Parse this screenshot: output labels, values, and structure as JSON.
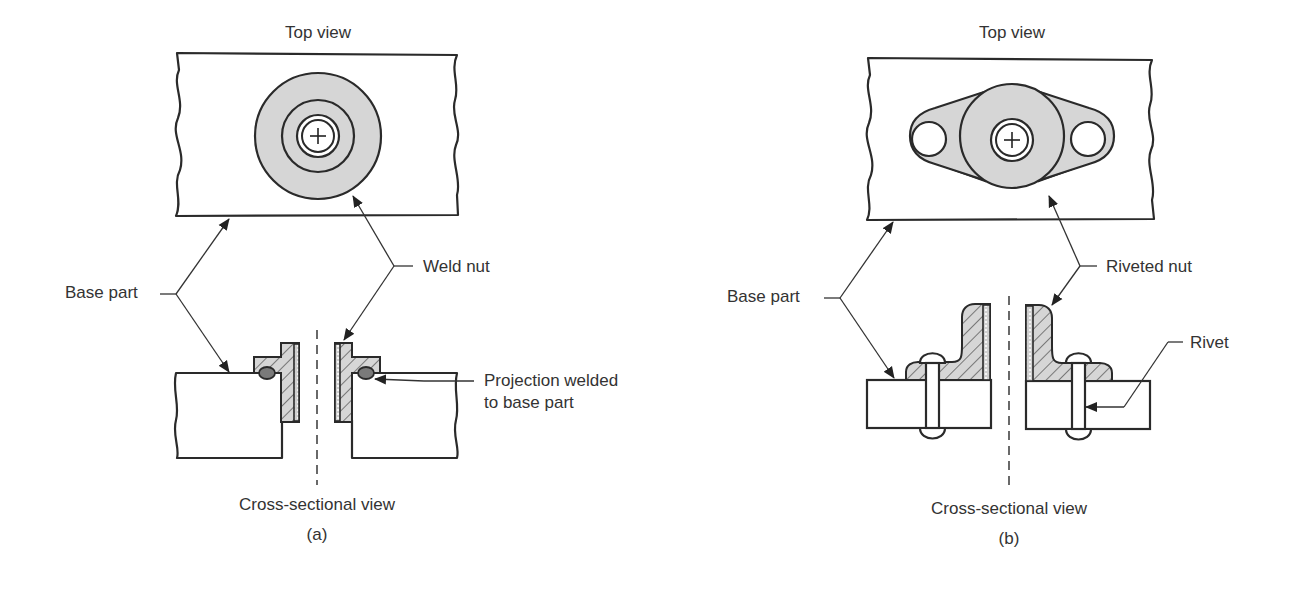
{
  "figure": {
    "panels": [
      {
        "id": "a",
        "caption": "(a)",
        "top_view_label": "Top view",
        "section_label": "Cross-sectional view",
        "callouts": {
          "base_part": "Base part",
          "fastener": "Weld nut",
          "weld": "Projection welded",
          "weld_line2": "to base part"
        }
      },
      {
        "id": "b",
        "caption": "(b)",
        "top_view_label": "Top view",
        "section_label": "Cross-sectional view",
        "callouts": {
          "base_part": "Base part",
          "fastener": "Riveted nut",
          "rivet": "Rivet"
        }
      }
    ],
    "colors": {
      "line": "#2a2a2a",
      "nut_fill": "#d6d6d6",
      "text": "#333333"
    }
  }
}
